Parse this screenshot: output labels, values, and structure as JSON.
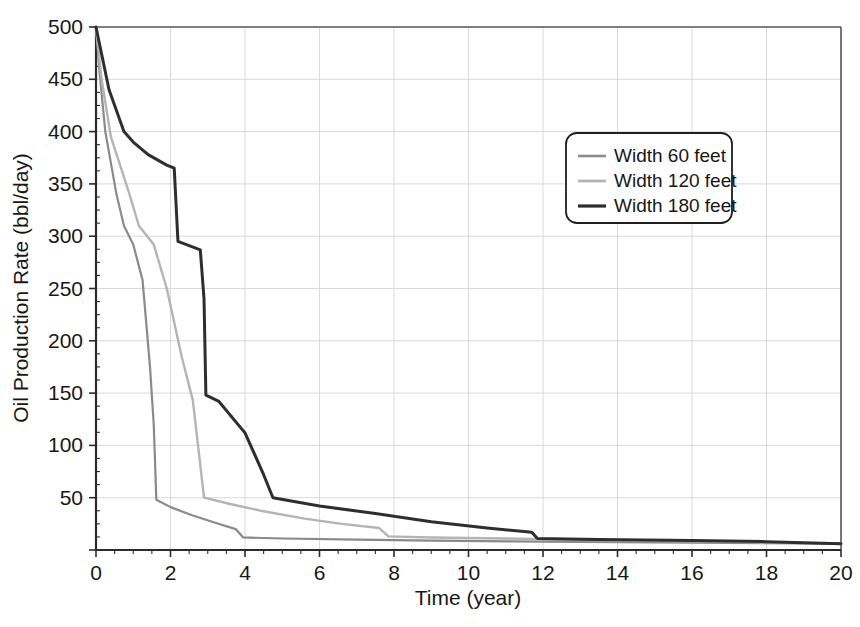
{
  "chart_data": {
    "type": "line",
    "title": "",
    "xlabel": "Time (year)",
    "ylabel": "Oil Production Rate (bbl/day)",
    "xlim": [
      0,
      20
    ],
    "ylim": [
      0,
      500
    ],
    "xticks": [
      0,
      2,
      4,
      6,
      8,
      10,
      12,
      14,
      16,
      18,
      20
    ],
    "xtick_labels": [
      "0",
      "2",
      "4",
      "6",
      "8",
      "10",
      "12",
      "14",
      "16",
      "18",
      "20"
    ],
    "yticks": [
      0,
      50,
      100,
      150,
      200,
      250,
      300,
      350,
      400,
      450,
      500
    ],
    "ytick_labels": [
      "",
      "50",
      "100",
      "150",
      "200",
      "250",
      "300",
      "350",
      "400",
      "450",
      "500"
    ],
    "grid": true,
    "minor_ticks": true,
    "legend_position": "upper-right",
    "series": [
      {
        "name": "Width 60 feet",
        "color": "#8a8a8a",
        "width": 2.2,
        "points": [
          [
            0.0,
            500
          ],
          [
            0.1,
            455
          ],
          [
            0.25,
            400
          ],
          [
            0.55,
            340
          ],
          [
            0.75,
            310
          ],
          [
            1.0,
            292
          ],
          [
            1.25,
            258
          ],
          [
            1.45,
            175
          ],
          [
            1.55,
            120
          ],
          [
            1.62,
            48
          ],
          [
            2.0,
            41
          ],
          [
            2.6,
            33
          ],
          [
            3.2,
            26
          ],
          [
            3.75,
            20
          ],
          [
            3.95,
            12
          ],
          [
            5.0,
            11
          ],
          [
            7.0,
            10
          ],
          [
            9.0,
            9
          ],
          [
            12.0,
            8
          ],
          [
            16.0,
            7
          ],
          [
            20.0,
            6
          ]
        ]
      },
      {
        "name": "Width 120 feet",
        "color": "#b4b4b4",
        "width": 2.4,
        "points": [
          [
            0.0,
            500
          ],
          [
            0.15,
            450
          ],
          [
            0.4,
            395
          ],
          [
            0.9,
            340
          ],
          [
            1.15,
            310
          ],
          [
            1.55,
            292
          ],
          [
            1.9,
            250
          ],
          [
            2.3,
            185
          ],
          [
            2.6,
            143
          ],
          [
            2.9,
            50
          ],
          [
            3.6,
            44
          ],
          [
            4.5,
            37
          ],
          [
            5.6,
            30
          ],
          [
            6.6,
            25
          ],
          [
            7.6,
            21
          ],
          [
            7.85,
            13
          ],
          [
            9.0,
            12
          ],
          [
            11.0,
            11
          ],
          [
            14.0,
            9
          ],
          [
            17.0,
            8
          ],
          [
            20.0,
            6
          ]
        ]
      },
      {
        "name": "Width 180 feet",
        "color": "#2e2e2e",
        "width": 3.0,
        "points": [
          [
            0.0,
            500
          ],
          [
            0.35,
            440
          ],
          [
            0.75,
            400
          ],
          [
            1.0,
            390
          ],
          [
            1.4,
            378
          ],
          [
            1.9,
            368
          ],
          [
            2.1,
            365
          ],
          [
            2.2,
            295
          ],
          [
            2.8,
            287
          ],
          [
            2.9,
            240
          ],
          [
            2.95,
            148
          ],
          [
            3.3,
            142
          ],
          [
            4.0,
            112
          ],
          [
            4.5,
            72
          ],
          [
            4.75,
            50
          ],
          [
            6.0,
            42
          ],
          [
            7.5,
            35
          ],
          [
            9.0,
            27
          ],
          [
            10.5,
            21
          ],
          [
            11.7,
            17
          ],
          [
            11.85,
            11
          ],
          [
            13.5,
            10
          ],
          [
            16.0,
            9
          ],
          [
            18.0,
            8
          ],
          [
            20.0,
            6
          ]
        ]
      }
    ]
  },
  "legend": {
    "entries": [
      {
        "label": "Width 60 feet"
      },
      {
        "label": "Width 120 feet"
      },
      {
        "label": "Width 180 feet"
      }
    ]
  }
}
